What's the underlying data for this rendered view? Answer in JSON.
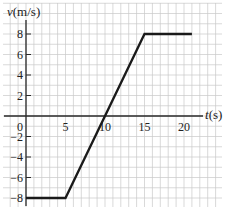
{
  "chart_data": {
    "type": "line",
    "title": "",
    "xlabel": "t(s)",
    "ylabel": "v(m/s)",
    "xlabel_italic_part": "t",
    "xlabel_unit": "(s)",
    "ylabel_italic_part": "v",
    "ylabel_unit": "(m/s)",
    "xlim": [
      -3,
      25
    ],
    "ylim": [
      -9,
      11
    ],
    "grid": true,
    "grid_step_x": 1,
    "grid_step_y": 1,
    "x_ticks": [
      5,
      10,
      15,
      20
    ],
    "x_tick_labels": [
      "5",
      "10",
      "15",
      "20"
    ],
    "origin_label": "0",
    "y_ticks": [
      8,
      6,
      4,
      2,
      -2,
      -4,
      -6,
      -8
    ],
    "y_tick_labels": [
      "8",
      "6",
      "4",
      "2",
      "−2",
      "−4",
      "−6",
      "−8"
    ],
    "series": [
      {
        "name": "velocity",
        "color": "#1a1a1a",
        "x": [
          0,
          5,
          15,
          21
        ],
        "y": [
          -8,
          -8,
          8,
          8
        ]
      }
    ]
  }
}
